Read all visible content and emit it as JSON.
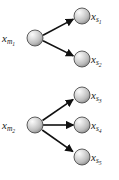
{
  "figure": {
    "background_color": "#ffffff",
    "width": 119,
    "height": 180
  },
  "style": {
    "node_fill_light": "#f2f2f2",
    "node_fill_mid": "#c8c8c8",
    "node_fill_dark": "#8f8f8f",
    "node_stroke": "#4d4d4d",
    "edge_color": "#111111",
    "label_color": "#1a1a1a",
    "node_radius": 8.0,
    "edge_width": 1.6
  },
  "nodes": [
    {
      "id": "x_m1",
      "role": "source",
      "group": 1,
      "base": "x",
      "sub": "m",
      "subsub": "1",
      "label_text": "x",
      "cx": 35,
      "cy": 38,
      "label_x": 2,
      "label_y": 33
    },
    {
      "id": "x_s1",
      "role": "target",
      "group": 1,
      "base": "x",
      "sub": "s",
      "subsub": "1",
      "label_text": "x",
      "cx": 82,
      "cy": 16,
      "label_x": 91,
      "label_y": 11
    },
    {
      "id": "x_s2",
      "role": "target",
      "group": 1,
      "base": "x",
      "sub": "s",
      "subsub": "2",
      "label_text": "x",
      "cx": 82,
      "cy": 59,
      "label_x": 91,
      "label_y": 54
    },
    {
      "id": "x_m2",
      "role": "source",
      "group": 2,
      "base": "x",
      "sub": "m",
      "subsub": "2",
      "label_text": "x",
      "cx": 35,
      "cy": 125,
      "label_x": 2,
      "label_y": 120
    },
    {
      "id": "x_s3",
      "role": "target",
      "group": 2,
      "base": "x",
      "sub": "s",
      "subsub": "3",
      "label_text": "x",
      "cx": 82,
      "cy": 95,
      "label_x": 91,
      "label_y": 90
    },
    {
      "id": "x_s4",
      "role": "target",
      "group": 2,
      "base": "x",
      "sub": "s",
      "subsub": "4",
      "label_text": "x",
      "cx": 82,
      "cy": 125,
      "label_x": 91,
      "label_y": 120
    },
    {
      "id": "x_s5",
      "role": "target",
      "group": 2,
      "base": "x",
      "sub": "s",
      "subsub": "5",
      "label_text": "x",
      "cx": 82,
      "cy": 157,
      "label_x": 91,
      "label_y": 152
    }
  ],
  "edges": [
    {
      "id": "edge-m1-s1",
      "from": "x_m1",
      "to": "x_s1",
      "x1": 43.0,
      "y1": 35.3,
      "x2": 73.4,
      "y2": 19.1
    },
    {
      "id": "edge-m1-s2",
      "from": "x_m1",
      "to": "x_s2",
      "x1": 43.0,
      "y1": 40.7,
      "x2": 73.4,
      "y2": 55.9
    },
    {
      "id": "edge-m2-s3",
      "from": "x_m2",
      "to": "x_s3",
      "x1": 42.5,
      "y1": 120.5,
      "x2": 73.2,
      "y2": 99.4
    },
    {
      "id": "edge-m2-s4",
      "from": "x_m2",
      "to": "x_s4",
      "x1": 43.0,
      "y1": 125.0,
      "x2": 73.5,
      "y2": 125.0
    },
    {
      "id": "edge-m2-s5",
      "from": "x_m2",
      "to": "x_s5",
      "x1": 42.2,
      "y1": 130.0,
      "x2": 72.9,
      "y2": 151.6
    }
  ]
}
